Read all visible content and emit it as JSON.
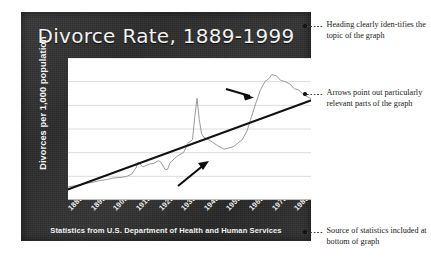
{
  "chart_data": {
    "type": "line",
    "title": "Divorce Rate, 1889-1999",
    "xlabel": "",
    "ylabel": "Divorces per 1,000 population",
    "source": "Statistics from U.S. Department of Health and Human Services",
    "xlim": [
      1889,
      1999
    ],
    "ylim": [
      0,
      6
    ],
    "grid": true,
    "legend": "none",
    "y_ticks": [
      "0",
      "1",
      "2",
      "3",
      "4",
      "5",
      "6"
    ],
    "x_ticks": [
      "1889",
      "1899",
      "1909",
      "1919",
      "1929",
      "1939",
      "1949",
      "1959",
      "1969",
      "1979",
      "1989",
      "1999"
    ],
    "series": [
      {
        "name": "Divorce rate",
        "style": "line",
        "color": "#9a9a9a",
        "x": [
          1889,
          1893,
          1897,
          1900,
          1903,
          1906,
          1909,
          1912,
          1915,
          1917,
          1919,
          1920,
          1922,
          1925,
          1927,
          1929,
          1930,
          1932,
          1933,
          1934,
          1936,
          1938,
          1940,
          1942,
          1944,
          1945,
          1946,
          1947,
          1948,
          1949,
          1950,
          1952,
          1955,
          1958,
          1960,
          1962,
          1964,
          1966,
          1968,
          1970,
          1972,
          1974,
          1976,
          1978,
          1979,
          1981,
          1983,
          1985,
          1987,
          1989,
          1991,
          1993,
          1995,
          1997,
          1999
        ],
        "values": [
          0.55,
          0.62,
          0.7,
          0.75,
          0.82,
          0.86,
          0.93,
          0.95,
          1.0,
          1.08,
          1.35,
          1.6,
          1.4,
          1.52,
          1.55,
          1.66,
          1.6,
          1.28,
          1.3,
          1.55,
          1.75,
          1.9,
          2.0,
          2.4,
          2.55,
          3.5,
          4.3,
          3.4,
          2.8,
          2.65,
          2.6,
          2.5,
          2.3,
          2.15,
          2.2,
          2.25,
          2.4,
          2.55,
          2.9,
          3.5,
          4.1,
          4.65,
          5.0,
          5.15,
          5.3,
          5.25,
          5.05,
          5.0,
          4.9,
          4.7,
          4.65,
          4.45,
          4.35,
          4.25,
          4.1
        ]
      },
      {
        "name": "Trend line",
        "style": "trend",
        "color": "#111111",
        "x": [
          1889,
          1999
        ],
        "values": [
          0.45,
          4.3
        ]
      }
    ],
    "annotations": [
      {
        "name": "arrow-upper",
        "points_to": "1970s peak rise",
        "x_from": 1976,
        "y_from": 5.3,
        "direction": "right"
      },
      {
        "name": "arrow-lower",
        "points_to": "1950s plateau",
        "x_from": 1953,
        "y_from": 2.2,
        "direction": "up-right"
      }
    ]
  },
  "callouts": [
    {
      "id": "heading",
      "text": "Heading clearly iden-tifies the topic of the graph"
    },
    {
      "id": "arrows",
      "text": "Arrows point out particularly relevant parts of the graph"
    },
    {
      "id": "source",
      "text": "Source of statistics included at bottom of graph"
    }
  ]
}
